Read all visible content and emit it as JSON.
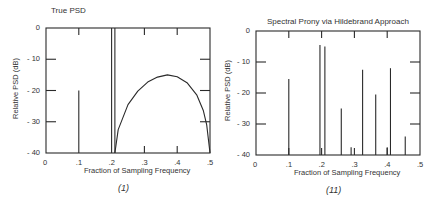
{
  "chart_data": [
    {
      "type": "line",
      "panel_caption": "(1)",
      "title": "True PSD",
      "xlabel": "Fraction of Sampling Frequency",
      "ylabel": "Relative PSD (dB)",
      "xlim": [
        0,
        0.5
      ],
      "ylim": [
        -40,
        0
      ],
      "xticks": [
        "0",
        ".1",
        ".2",
        ".3",
        ".4",
        ".5"
      ],
      "yticks": [
        "0",
        "- 10",
        "- 20",
        "- 30",
        "- 40"
      ],
      "grid": false,
      "lines": [
        {
          "name": "sinusoid 1",
          "x": 0.1,
          "top_db": -20
        },
        {
          "name": "sinusoid 2",
          "x": 0.2,
          "top_db": 0
        },
        {
          "name": "sinusoid 3",
          "x": 0.21,
          "top_db": 0
        }
      ],
      "series": [
        {
          "name": "colored noise",
          "x": [
            0.21,
            0.22,
            0.25,
            0.28,
            0.31,
            0.34,
            0.37,
            0.4,
            0.43,
            0.46,
            0.48,
            0.49,
            0.5
          ],
          "values": [
            -40,
            -32.5,
            -24.5,
            -20.2,
            -17.3,
            -15.7,
            -15.0,
            -15.6,
            -17.5,
            -21.5,
            -26.5,
            -31,
            -40
          ]
        }
      ]
    },
    {
      "type": "bar",
      "panel_caption": "(11)",
      "title": "Spectral Prony via Hildebrand Approach",
      "xlabel": "Fraction of Sampling Frequency",
      "ylabel": "Relative PSD (dB)",
      "xlim": [
        0,
        0.5
      ],
      "ylim": [
        -40,
        0
      ],
      "xticks": [
        "0",
        ".1",
        ".2",
        ".3",
        ".4",
        ".5"
      ],
      "yticks": [
        "0",
        "- 10",
        "- 20",
        "- 30",
        "- 40"
      ],
      "grid": false,
      "x": [
        0.1,
        0.195,
        0.21,
        0.26,
        0.29,
        0.325,
        0.365,
        0.4,
        0.41,
        0.455
      ],
      "values": [
        -15.5,
        -4.5,
        -5,
        -25,
        -37.5,
        -12.5,
        -20.5,
        -37.5,
        -12,
        -34
      ]
    }
  ]
}
